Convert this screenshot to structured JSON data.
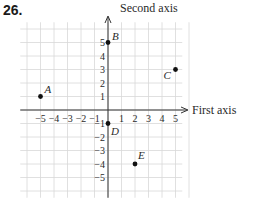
{
  "problem_number": "26.",
  "chart_data": {
    "type": "scatter",
    "title": "",
    "xlabel": "First axis",
    "ylabel": "Second axis",
    "xlim": [
      -5,
      5
    ],
    "ylim": [
      -5,
      5
    ],
    "grid": true,
    "x_ticks": [
      "-5",
      "-4",
      "-3",
      "-2",
      "-1",
      "1",
      "2",
      "3",
      "4",
      "5"
    ],
    "y_ticks": [
      "5",
      "4",
      "3",
      "2",
      "1",
      "-1",
      "-2",
      "-3",
      "-4",
      "-5"
    ],
    "points": [
      {
        "label": "A",
        "x": -5,
        "y": 1
      },
      {
        "label": "B",
        "x": 0,
        "y": 5
      },
      {
        "label": "C",
        "x": 5,
        "y": 3
      },
      {
        "label": "D",
        "x": 0,
        "y": -1
      },
      {
        "label": "E",
        "x": 2,
        "y": -4
      }
    ]
  },
  "colors": {
    "grid": "#d8d8d8",
    "axis": "#333333",
    "point": "#111111"
  }
}
